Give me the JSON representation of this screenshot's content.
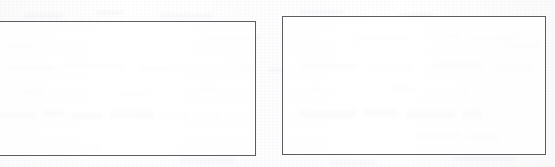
{
  "document": {
    "kind": "scanned-worksheet-fragment",
    "background_color": "#fdfdfd",
    "border_color": "#5b5d62",
    "box_fill_color": "#ffffff",
    "ghost_ink_color": "#6c6e7a"
  },
  "boxes": [
    {
      "id": "left",
      "name": "Left answer box",
      "content": "",
      "x": -10,
      "y": 21,
      "width": 266,
      "height": 135,
      "clipped_edge": "left"
    },
    {
      "id": "right",
      "name": "Right answer box",
      "content": "",
      "x": 282,
      "y": 16,
      "width": 264,
      "height": 139,
      "clipped_edge": "none"
    }
  ],
  "ghost_marks": [
    {
      "x": 8,
      "y": 66,
      "w": 46,
      "h": 4,
      "tone": "s1"
    },
    {
      "x": 64,
      "y": 64,
      "w": 62,
      "h": 5,
      "tone": "s2"
    },
    {
      "x": 140,
      "y": 67,
      "w": 30,
      "h": 4,
      "tone": "s1"
    },
    {
      "x": 182,
      "y": 65,
      "w": 74,
      "h": 5,
      "tone": "s2"
    },
    {
      "x": 268,
      "y": 68,
      "w": 18,
      "h": 4,
      "tone": "s4"
    },
    {
      "x": 300,
      "y": 64,
      "w": 56,
      "h": 5,
      "tone": "s1"
    },
    {
      "x": 368,
      "y": 66,
      "w": 44,
      "h": 4,
      "tone": "s2"
    },
    {
      "x": 430,
      "y": 63,
      "w": 52,
      "h": 5,
      "tone": "s1"
    },
    {
      "x": 494,
      "y": 66,
      "w": 40,
      "h": 4,
      "tone": "s4"
    },
    {
      "x": 206,
      "y": 36,
      "w": 54,
      "h": 4,
      "tone": "s4"
    },
    {
      "x": 282,
      "y": 34,
      "w": 38,
      "h": 4,
      "tone": "s4"
    },
    {
      "x": 352,
      "y": 37,
      "w": 60,
      "h": 4,
      "tone": "s4"
    },
    {
      "x": 428,
      "y": 33,
      "w": 34,
      "h": 4,
      "tone": "s4"
    },
    {
      "x": 470,
      "y": 36,
      "w": 48,
      "h": 4,
      "tone": "s4"
    },
    {
      "x": 24,
      "y": 14,
      "w": 40,
      "h": 4,
      "tone": "s4"
    },
    {
      "x": 96,
      "y": 11,
      "w": 28,
      "h": 4,
      "tone": "s4"
    },
    {
      "x": 160,
      "y": 14,
      "w": 52,
      "h": 4,
      "tone": "s4"
    },
    {
      "x": 300,
      "y": 10,
      "w": 44,
      "h": 4,
      "tone": "s4"
    },
    {
      "x": 398,
      "y": 13,
      "w": 36,
      "h": 4,
      "tone": "s4"
    },
    {
      "x": 0,
      "y": 112,
      "w": 36,
      "h": 6,
      "tone": "s3"
    },
    {
      "x": 44,
      "y": 110,
      "w": 20,
      "h": 7,
      "tone": "s3"
    },
    {
      "x": 72,
      "y": 113,
      "w": 30,
      "h": 6,
      "tone": "s3"
    },
    {
      "x": 110,
      "y": 111,
      "w": 44,
      "h": 7,
      "tone": "s3"
    },
    {
      "x": 162,
      "y": 113,
      "w": 26,
      "h": 6,
      "tone": "s4"
    },
    {
      "x": 198,
      "y": 114,
      "w": 22,
      "h": 5,
      "tone": "s4"
    },
    {
      "x": 300,
      "y": 110,
      "w": 56,
      "h": 8,
      "tone": "s3"
    },
    {
      "x": 364,
      "y": 109,
      "w": 34,
      "h": 8,
      "tone": "s3"
    },
    {
      "x": 406,
      "y": 111,
      "w": 50,
      "h": 7,
      "tone": "s3"
    },
    {
      "x": 462,
      "y": 110,
      "w": 20,
      "h": 8,
      "tone": "s3"
    },
    {
      "x": 418,
      "y": 132,
      "w": 42,
      "h": 6,
      "tone": "s2"
    },
    {
      "x": 466,
      "y": 134,
      "w": 34,
      "h": 6,
      "tone": "s2"
    },
    {
      "x": 308,
      "y": 88,
      "w": 18,
      "h": 4,
      "tone": "s4"
    },
    {
      "x": 388,
      "y": 86,
      "w": 26,
      "h": 4,
      "tone": "s4"
    },
    {
      "x": 452,
      "y": 89,
      "w": 16,
      "h": 4,
      "tone": "s4"
    },
    {
      "x": 20,
      "y": 90,
      "w": 24,
      "h": 4,
      "tone": "s4"
    },
    {
      "x": 120,
      "y": 92,
      "w": 30,
      "h": 4,
      "tone": "s4"
    },
    {
      "x": 196,
      "y": 88,
      "w": 22,
      "h": 4,
      "tone": "s4"
    },
    {
      "x": 60,
      "y": 146,
      "w": 40,
      "h": 5,
      "tone": "s4"
    },
    {
      "x": 180,
      "y": 158,
      "w": 54,
      "h": 5,
      "tone": "s4"
    },
    {
      "x": 330,
      "y": 160,
      "w": 46,
      "h": 5,
      "tone": "s4"
    },
    {
      "x": 452,
      "y": 156,
      "w": 62,
      "h": 5,
      "tone": "s4"
    },
    {
      "x": 500,
      "y": 44,
      "w": 40,
      "h": 4,
      "tone": "s4"
    },
    {
      "x": 8,
      "y": 44,
      "w": 30,
      "h": 4,
      "tone": "s4"
    }
  ]
}
